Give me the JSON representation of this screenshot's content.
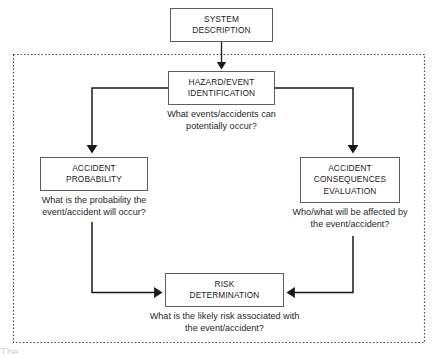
{
  "diagram": {
    "boundary": {
      "name": "risk-analysis-boundary",
      "style": "dotted",
      "color": "#4a4a4a"
    },
    "colors": {
      "box_border": "#5e5e5e",
      "box_fill": "#ffffff",
      "connector": "#1a1a1a",
      "text": "#1b1b1b",
      "caption_text": "#1f1f1f"
    },
    "nodes": [
      {
        "id": "system-description",
        "lines": [
          "SYSTEM",
          "DESCRIPTION"
        ],
        "caption": []
      },
      {
        "id": "hazard-event-identification",
        "lines": [
          "HAZARD/EVENT",
          "IDENTIFICATION"
        ],
        "caption": [
          "What events/accidents can",
          "potentially occur?"
        ]
      },
      {
        "id": "accident-probability",
        "lines": [
          "ACCIDENT",
          "PROBABILITY"
        ],
        "caption": [
          "What is the probability the",
          "event/accident will occur?"
        ]
      },
      {
        "id": "accident-consequences-evaluation",
        "lines": [
          "ACCIDENT",
          "CONSEQUENCES",
          "EVALUATION"
        ],
        "caption": [
          "Who/what will be affected by",
          "the event/accident?"
        ]
      },
      {
        "id": "risk-determination",
        "lines": [
          "RISK",
          "DETERMINATION"
        ],
        "caption": [
          "What is the likely risk associated with",
          "the event/accident?"
        ]
      }
    ],
    "connectors": [
      {
        "id": "system-to-hazard",
        "from": "system-description",
        "to": "hazard-event-identification",
        "arrow": true
      },
      {
        "id": "hazard-to-probability",
        "from": "hazard-event-identification",
        "to": "accident-probability",
        "arrow": true
      },
      {
        "id": "hazard-to-consequences",
        "from": "hazard-event-identification",
        "to": "accident-consequences-evaluation",
        "arrow": true
      },
      {
        "id": "probability-to-risk",
        "from": "accident-probability",
        "to": "risk-determination",
        "arrow": true
      },
      {
        "id": "consequences-to-risk",
        "from": "accident-consequences-evaluation",
        "to": "risk-determination",
        "arrow": true
      }
    ],
    "footer_artifact": "The"
  }
}
